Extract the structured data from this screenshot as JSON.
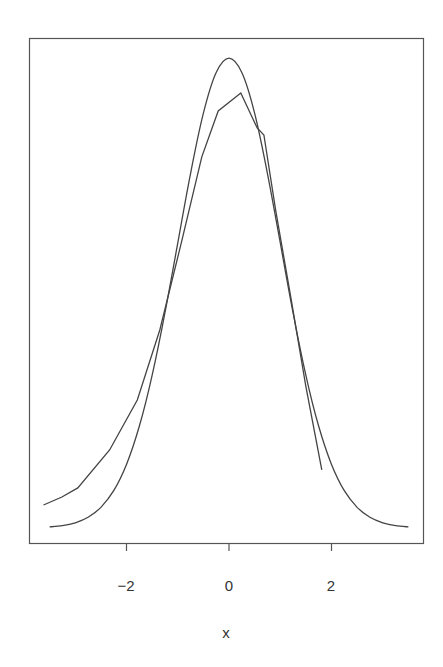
{
  "chart_data": {
    "type": "line",
    "title": "",
    "xlabel": "x",
    "ylabel": "",
    "xlim": [
      -3.88,
      3.81
    ],
    "ylim": [
      0,
      0.4
    ],
    "x_ticks": [
      -2,
      0,
      2
    ],
    "x_tick_labels": [
      "−2",
      "0",
      "2"
    ],
    "y_ticks": [],
    "grid": false,
    "legend": null,
    "frame": true,
    "series": [
      {
        "name": "normal-density",
        "style": "smooth",
        "color": "#444444",
        "x": [
          -3.5,
          -3.25,
          -3.0,
          -2.75,
          -2.5,
          -2.25,
          -2.0,
          -1.75,
          -1.5,
          -1.25,
          -1.0,
          -0.75,
          -0.5,
          -0.25,
          0.0,
          0.25,
          0.5,
          0.75,
          1.0,
          1.25,
          1.5,
          1.75,
          2.0,
          2.25,
          2.5,
          2.75,
          3.0,
          3.25,
          3.5
        ],
        "y": [
          0.0009,
          0.002,
          0.0044,
          0.0091,
          0.0175,
          0.0317,
          0.054,
          0.0863,
          0.1295,
          0.1826,
          0.242,
          0.3011,
          0.3521,
          0.3867,
          0.3989,
          0.3867,
          0.3521,
          0.3011,
          0.242,
          0.1826,
          0.1295,
          0.0863,
          0.054,
          0.0317,
          0.0175,
          0.0091,
          0.0044,
          0.002,
          0.0009
        ]
      },
      {
        "name": "empirical-density",
        "style": "polyline",
        "color": "#444444",
        "x": [
          -3.62,
          -3.26,
          -2.95,
          -2.33,
          -1.79,
          -1.35,
          -0.93,
          -0.53,
          -0.21,
          0.23,
          0.55,
          0.68,
          0.91,
          1.21,
          1.5,
          1.81
        ],
        "y": [
          0.0195,
          0.0263,
          0.034,
          0.0662,
          0.1087,
          0.1681,
          0.242,
          0.315,
          0.354,
          0.3693,
          0.3396,
          0.3336,
          0.27,
          0.195,
          0.12,
          0.0493
        ]
      }
    ]
  },
  "axis": {
    "x_title": "x",
    "tick_labels": [
      "−2",
      "0",
      "2"
    ]
  }
}
